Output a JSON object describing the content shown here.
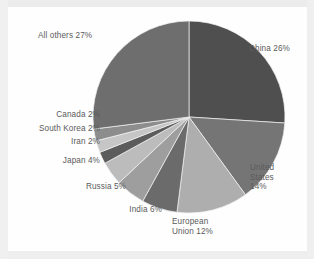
{
  "chart_data": {
    "type": "pie",
    "title": "",
    "subtitle": "",
    "xlabel": "",
    "ylabel": "",
    "legend_position": "none",
    "grid": false,
    "labels_placement": "outside",
    "start_angle_clock": "12 o'clock",
    "direction": "clockwise",
    "units": "percent",
    "total": 100,
    "categories": [
      "China",
      "United States",
      "European Union",
      "India",
      "Russia",
      "Japan",
      "Iran",
      "South Korea",
      "Canada",
      "All others"
    ],
    "values": [
      26,
      14,
      12,
      6,
      5,
      4,
      2,
      2,
      2,
      27
    ],
    "colors": [
      "#4f4f4f",
      "#757575",
      "#aeaeae",
      "#6b6b6b",
      "#9e9e9e",
      "#bcbcbc",
      "#5c5c5c",
      "#c6c6c6",
      "#8d8d8d",
      "#6e6e6e"
    ],
    "slices": [
      {
        "name": "China",
        "value": 26,
        "color": "#4f4f4f",
        "label": "China 26%"
      },
      {
        "name": "United States",
        "value": 14,
        "color": "#757575",
        "label": "United\nStates\n14%"
      },
      {
        "name": "European Union",
        "value": 12,
        "color": "#aeaeae",
        "label": "European\nUnion 12%"
      },
      {
        "name": "India",
        "value": 6,
        "color": "#6b6b6b",
        "label": "India 6%"
      },
      {
        "name": "Russia",
        "value": 5,
        "color": "#9e9e9e",
        "label": "Russia 5%"
      },
      {
        "name": "Japan",
        "value": 4,
        "color": "#bcbcbc",
        "label": "Japan 4%"
      },
      {
        "name": "Iran",
        "value": 2,
        "color": "#5c5c5c",
        "label": "Iran 2%"
      },
      {
        "name": "South Korea",
        "value": 2,
        "color": "#c6c6c6",
        "label": "South Korea 2%"
      },
      {
        "name": "Canada",
        "value": 2,
        "color": "#8d8d8d",
        "label": "Canada 2%"
      },
      {
        "name": "All others",
        "value": 27,
        "color": "#6e6e6e",
        "label": "All others 27%"
      }
    ],
    "geometry": {
      "center_x": 189,
      "center_y": 117,
      "radius": 96
    },
    "style": {
      "background": "#fefefe",
      "label_color": "#5b5b5b",
      "slice_border": "#f2f2f2"
    }
  },
  "labels": {
    "china": "China 26%",
    "united_states": "United\nStates\n14%",
    "european_union": "European\nUnion 12%",
    "india": "India 6%",
    "russia": "Russia 5%",
    "japan": "Japan 4%",
    "iran": "Iran 2%",
    "south_korea": "South Korea 2%",
    "canada": "Canada 2%",
    "all_others": "All others 27%"
  }
}
